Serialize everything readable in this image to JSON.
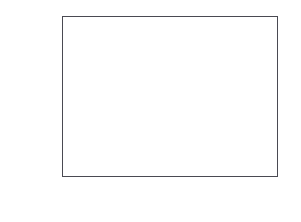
{
  "figure": {
    "label": "3."
  },
  "chart_data": {
    "type": "scatter",
    "title": "",
    "subtitle": "",
    "xlabel": "",
    "ylabel": "",
    "grid": false,
    "legend": null,
    "yscale": "probability (normal probit)",
    "xscale": "linear",
    "xlim": [
      1.65,
      4.85
    ],
    "ylim": [
      0.0007,
      0.9993
    ],
    "yticks": [
      0.001,
      0.01,
      0.05,
      0.1,
      0.25,
      0.5,
      0.75,
      0.9,
      0.95,
      0.99,
      0.999
    ],
    "ytick_labels": [
      "0.001",
      "0.01",
      "0.05",
      "0.1",
      "0.25",
      "0.5",
      "0.75",
      "0.9",
      "0.95",
      "0.99",
      "0.999"
    ],
    "xticks": [
      2,
      2.5,
      3,
      3.5,
      4,
      4.5
    ],
    "xtick_labels": [
      "2",
      "2.5",
      "3",
      "3.5",
      "4",
      "4.5"
    ],
    "frame": "box-all-sides-ticks",
    "marker": "filled-circle",
    "marker_color": "#151515",
    "line_color": "#2a2a2a",
    "series": [
      {
        "name": "data",
        "x": [
          1.8,
          1.82,
          1.84,
          1.85,
          1.86,
          1.88,
          2.0,
          2.0,
          2.02,
          2.3,
          2.52,
          3.28,
          3.38,
          3.46,
          3.54,
          3.62,
          3.7,
          3.76,
          3.8,
          3.82,
          3.84,
          3.86,
          3.88,
          3.9,
          3.98,
          4.0,
          4.02,
          4.04,
          4.06,
          4.1,
          4.14,
          4.18,
          4.22,
          4.26,
          4.3,
          4.34,
          4.38,
          4.4,
          4.42,
          4.44,
          4.46,
          4.5,
          4.52,
          4.54,
          4.56,
          4.58,
          4.6,
          4.62,
          4.64,
          4.66,
          4.7
        ],
        "y": [
          0.0125,
          0.04,
          0.048,
          0.055,
          0.085,
          0.062,
          0.12,
          0.15,
          0.185,
          0.23,
          0.255,
          0.195,
          0.2,
          0.205,
          0.212,
          0.22,
          0.232,
          0.245,
          0.26,
          0.28,
          0.3,
          0.32,
          0.34,
          0.355,
          0.33,
          0.35,
          0.37,
          0.395,
          0.42,
          0.44,
          0.46,
          0.49,
          0.52,
          0.545,
          0.57,
          0.6,
          0.62,
          0.64,
          0.66,
          0.68,
          0.7,
          0.72,
          0.74,
          0.76,
          0.78,
          0.8,
          0.83,
          0.88,
          0.91,
          0.935,
          0.965
        ]
      }
    ],
    "reference_line": {
      "name": "fitted normal reference line",
      "x_start": 1.7,
      "y_start": 0.03,
      "x_end": 4.82,
      "y_end": 0.8
    }
  }
}
